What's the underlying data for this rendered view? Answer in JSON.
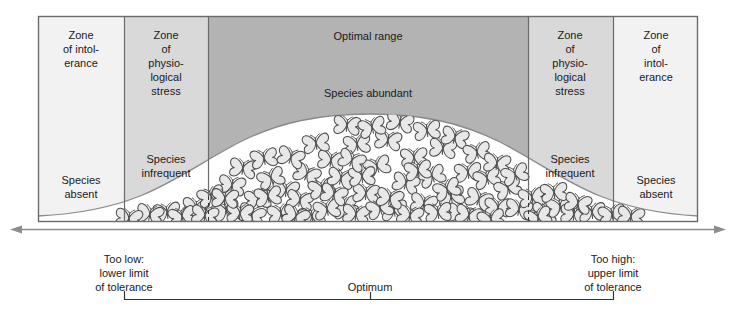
{
  "diagram": {
    "frame": {
      "x": 38,
      "y": 16,
      "width": 660,
      "height": 206
    },
    "colors": {
      "zone_intolerance_fill": "#f2f2f2",
      "zone_stress_fill": "#d9d9d9",
      "zone_optimal_fill": "#b3b3b3",
      "curve_fill": "#ffffff",
      "outline": "#6b6b6b",
      "text": "#1a1a1a",
      "axis": "#8c8c8c"
    },
    "zones": [
      {
        "id": "left-intolerance",
        "x": 38,
        "width": 86,
        "shade": "light",
        "top_label": "Zone\nof intol-\nerance",
        "bottom_label": "Species\nabsent"
      },
      {
        "id": "left-stress",
        "x": 124,
        "width": 84,
        "shade": "medium",
        "top_label": "Zone\nof\nphysio-\nlogical\nstress",
        "bottom_label": "Species\ninfrequent"
      },
      {
        "id": "optimal",
        "x": 208,
        "width": 320,
        "shade": "dark",
        "top_label": "Optimal range",
        "bottom_label": "Species abundant"
      },
      {
        "id": "right-stress",
        "x": 528,
        "width": 85,
        "shade": "medium",
        "top_label": "Zone\nof\nphysio-\nlogical\nstress",
        "bottom_label": "Species\ninfrequent"
      },
      {
        "id": "right-intolerance",
        "x": 613,
        "width": 85,
        "shade": "light",
        "top_label": "Zone\nof\nintol-\nerance",
        "bottom_label": "Species\nabsent"
      }
    ],
    "zone_text": {
      "left_intolerance_top": [
        "Zone",
        "of intol-",
        "erance"
      ],
      "left_intolerance_bottom": [
        "Species",
        "absent"
      ],
      "left_stress_top": [
        "Zone",
        "of",
        "physio-",
        "logical",
        "stress"
      ],
      "left_stress_bottom": [
        "Species",
        "infrequent"
      ],
      "optimal_top": "Optimal range",
      "optimal_bottom": "Species abundant",
      "right_stress_top": [
        "Zone",
        "of",
        "physio-",
        "logical",
        "stress"
      ],
      "right_stress_bottom": [
        "Species",
        "infrequent"
      ],
      "right_intolerance_top": [
        "Zone",
        "of",
        "intol-",
        "erance"
      ],
      "right_intolerance_bottom": [
        "Species",
        "absent"
      ]
    },
    "axis": {
      "y": 229,
      "x_start": 10,
      "x_end": 726,
      "arrows": "both"
    },
    "callouts": {
      "low": [
        "Too low:",
        "lower limit",
        "of tolerance"
      ],
      "optimum": "Optimum",
      "high": [
        "Too high:",
        "upper limit",
        "of tolerance"
      ]
    },
    "bracket": {
      "x_start": 124,
      "x_end": 613,
      "y": 299,
      "tick_height": 8,
      "center_tick_x": 370
    },
    "curve": {
      "description": "bell-shaped species abundance curve",
      "baseline_y": 222,
      "peak_x": 370,
      "peak_y": 114,
      "left_foot_x": 38,
      "right_foot_x": 698
    },
    "butterflies": {
      "symbol_name": "butterfly",
      "count": 78,
      "fill": "#e8e8e8",
      "stroke": "#4d4d4d"
    }
  }
}
